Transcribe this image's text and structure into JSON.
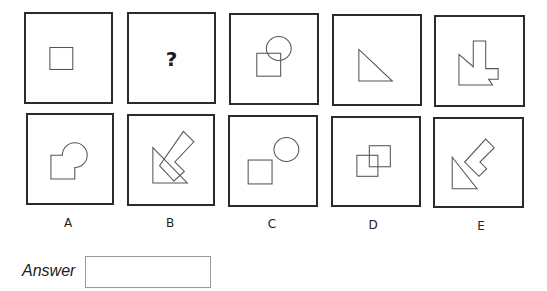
{
  "question": {
    "sequence": [
      {
        "id": "seq-1",
        "shape": "square"
      },
      {
        "id": "seq-2",
        "shape": "question-mark",
        "text": "?"
      },
      {
        "id": "seq-3",
        "shape": "square-overlapping-circle"
      },
      {
        "id": "seq-4",
        "shape": "right-triangle"
      },
      {
        "id": "seq-5",
        "shape": "triangle-merged-with-l-shape"
      }
    ]
  },
  "options": [
    {
      "label": "A",
      "shape": "square-merged-with-circle"
    },
    {
      "label": "B",
      "shape": "triangle-overlapping-rotated-l-shape"
    },
    {
      "label": "C",
      "shape": "square-and-separate-circle"
    },
    {
      "label": "D",
      "shape": "two-overlapping-squares"
    },
    {
      "label": "E",
      "shape": "triangle-and-separate-rotated-l-shape"
    }
  ],
  "answer": {
    "label": "Answer",
    "value": "",
    "placeholder": ""
  },
  "colors": {
    "border": "#2b2b2b",
    "shape_stroke": "#555555",
    "input_border": "#9a9a9a"
  }
}
